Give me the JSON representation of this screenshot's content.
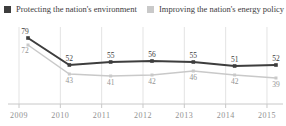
{
  "chart_data": {
    "type": "line",
    "title": "",
    "x": [
      "2009",
      "2010",
      "2011",
      "2012",
      "2013",
      "2014",
      "2015"
    ],
    "series": [
      {
        "name": "Protecting the nation's environment",
        "color": "#3d3d3d",
        "label_color": "#3d3d3d",
        "values": [
          79,
          52,
          55,
          56,
          55,
          51,
          52
        ]
      },
      {
        "name": "Improving the nation's energy policy",
        "color": "#c9c9c9",
        "label_color": "#949494",
        "values": [
          72,
          43,
          41,
          42,
          46,
          42,
          39
        ]
      }
    ],
    "xlabel": "",
    "ylabel": "",
    "ylim": [
      30,
      85
    ],
    "grid": "vertical",
    "legend_position": "top",
    "data_labels": true
  },
  "axis": {
    "tick_color": "#919191",
    "line_color": "#c8c8c8",
    "grid_color": "#e3e3e3"
  }
}
